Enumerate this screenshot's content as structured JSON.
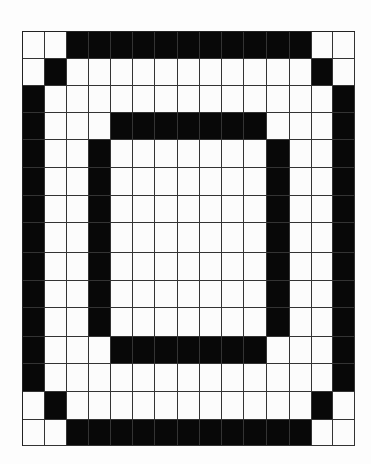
{
  "grid": {
    "rows": 15,
    "cols": 15,
    "filled_color": "#080808",
    "empty_color": "#fcfcfc",
    "line_color": "#333333",
    "pattern": [
      "001111111111100",
      "010000000000010",
      "100000000000001",
      "100011111110001",
      "100100000001001",
      "100100000001001",
      "100100000001001",
      "100100000001001",
      "100100000001001",
      "100100000001001",
      "100100000001001",
      "100011111110001",
      "100000000000001",
      "010000000000010",
      "001111111111100"
    ]
  }
}
